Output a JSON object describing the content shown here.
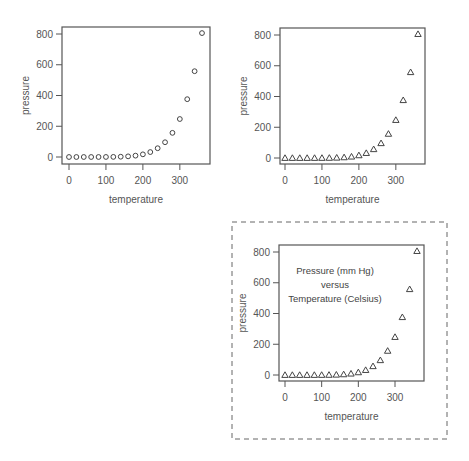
{
  "chart_data": [
    {
      "type": "scatter",
      "id": "plot-1",
      "marker": "circle",
      "title": "",
      "xlabel": "temperature",
      "ylabel": "pressure",
      "xlim": [
        0,
        360
      ],
      "ylim": [
        0,
        806.0
      ],
      "xticks": [
        0,
        100,
        200,
        300
      ],
      "yticks": [
        0,
        200,
        400,
        600,
        800
      ],
      "x": [
        0,
        20,
        40,
        60,
        80,
        100,
        120,
        140,
        160,
        180,
        200,
        220,
        240,
        260,
        280,
        300,
        320,
        340,
        360
      ],
      "y": [
        0.0002,
        0.0012,
        0.006,
        0.03,
        0.09,
        0.27,
        0.75,
        1.85,
        4.2,
        8.8,
        17.3,
        32.1,
        57.0,
        96.0,
        157.0,
        247.0,
        376.0,
        558.0,
        806.0
      ],
      "annotations": []
    },
    {
      "type": "scatter",
      "id": "plot-2",
      "marker": "triangle",
      "title": "",
      "xlabel": "temperature",
      "ylabel": "pressure",
      "xlim": [
        0,
        360
      ],
      "ylim": [
        0,
        806.0
      ],
      "xticks": [
        0,
        100,
        200,
        300
      ],
      "yticks": [
        0,
        200,
        400,
        600,
        800
      ],
      "x": [
        0,
        20,
        40,
        60,
        80,
        100,
        120,
        140,
        160,
        180,
        200,
        220,
        240,
        260,
        280,
        300,
        320,
        340,
        360
      ],
      "y": [
        0.0002,
        0.0012,
        0.006,
        0.03,
        0.09,
        0.27,
        0.75,
        1.85,
        4.2,
        8.8,
        17.3,
        32.1,
        57.0,
        96.0,
        157.0,
        247.0,
        376.0,
        558.0,
        806.0
      ],
      "annotations": []
    },
    {
      "type": "scatter",
      "id": "plot-3",
      "marker": "triangle",
      "title": "",
      "xlabel": "temperature",
      "ylabel": "pressure",
      "xlim": [
        0,
        360
      ],
      "ylim": [
        0,
        806.0
      ],
      "xticks": [
        0,
        100,
        200,
        300
      ],
      "yticks": [
        0,
        200,
        400,
        600,
        800
      ],
      "x": [
        0,
        20,
        40,
        60,
        80,
        100,
        120,
        140,
        160,
        180,
        200,
        220,
        240,
        260,
        280,
        300,
        320,
        340,
        360
      ],
      "y": [
        0.0002,
        0.0012,
        0.006,
        0.03,
        0.09,
        0.27,
        0.75,
        1.85,
        4.2,
        8.8,
        17.3,
        32.1,
        57.0,
        96.0,
        157.0,
        247.0,
        376.0,
        558.0,
        806.0
      ],
      "annotations": [
        "Pressure (mm Hg)",
        "versus",
        "Temperature (Celsius)"
      ],
      "border": "dashed"
    }
  ],
  "colors": {
    "axis": "#555555",
    "marker": "#444444",
    "dashed_border": "#666666",
    "background": "#ffffff"
  }
}
